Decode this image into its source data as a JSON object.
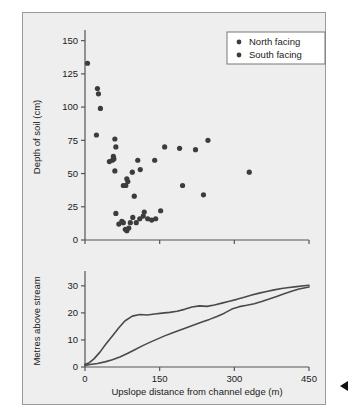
{
  "figure": {
    "background": "#eeeeee",
    "frame_color": "#9a9a9a",
    "annotation_marker": "left-pointing-triangle"
  },
  "legend": {
    "entries": [
      {
        "label": "North facing",
        "color": "#3c3c3c"
      },
      {
        "label": "South facing",
        "color": "#3c3c3c"
      }
    ]
  },
  "chart_data": [
    {
      "type": "scatter",
      "title": "",
      "xlabel": "",
      "ylabel": "Depth of soil (cm)",
      "xlim": [
        0,
        450
      ],
      "ylim": [
        0,
        155
      ],
      "xticks": [
        0,
        150,
        300,
        450
      ],
      "xtick_labels": [
        "",
        "",
        "",
        ""
      ],
      "yticks": [
        0,
        25,
        50,
        75,
        100,
        125,
        150
      ],
      "ytick_labels": [
        "0",
        "25",
        "50",
        "75",
        "100",
        "125",
        "150"
      ],
      "grid": false,
      "legend_position": "top-right",
      "series": [
        {
          "name": "North facing",
          "color": "#3c3c3c",
          "points": [
            [
              5,
              133
            ],
            [
              25,
              114
            ],
            [
              27,
              110
            ],
            [
              31,
              99
            ],
            [
              23,
              79
            ],
            [
              60,
              76
            ],
            [
              62,
              70
            ],
            [
              49,
              59
            ],
            [
              55,
              60
            ],
            [
              58,
              61
            ],
            [
              57,
              63
            ],
            [
              60,
              52
            ],
            [
              77,
              41
            ],
            [
              82,
              41
            ],
            [
              84,
              46
            ],
            [
              86,
              44
            ],
            [
              95,
              51
            ],
            [
              106,
              60
            ],
            [
              111,
              53
            ],
            [
              99,
              33
            ],
            [
              140,
              60
            ],
            [
              160,
              70
            ],
            [
              190,
              69
            ],
            [
              222,
              68
            ],
            [
              247,
              75
            ],
            [
              196,
              41
            ],
            [
              238,
              34
            ],
            [
              330,
              51
            ]
          ]
        },
        {
          "name": "South facing",
          "color": "#3c3c3c",
          "points": [
            [
              62,
              20
            ],
            [
              68,
              12
            ],
            [
              74,
              14
            ],
            [
              77,
              13
            ],
            [
              81,
              8
            ],
            [
              84,
              7
            ],
            [
              88,
              9
            ],
            [
              91,
              13
            ],
            [
              96,
              17
            ],
            [
              103,
              13
            ],
            [
              110,
              16
            ],
            [
              117,
              18
            ],
            [
              119,
              21
            ],
            [
              126,
              16
            ],
            [
              134,
              15
            ],
            [
              142,
              16
            ],
            [
              152,
              22
            ]
          ]
        }
      ]
    },
    {
      "type": "line",
      "title": "",
      "xlabel": "Upslope distance from channel edge (m)",
      "ylabel": "Metres above stream",
      "xlim": [
        0,
        450
      ],
      "ylim": [
        0,
        34
      ],
      "xticks": [
        0,
        150,
        300,
        450
      ],
      "xtick_labels": [
        "0",
        "150",
        "300",
        "450"
      ],
      "yticks": [
        0,
        10,
        20,
        30
      ],
      "ytick_labels": [
        "0",
        "10",
        "20",
        "30"
      ],
      "grid": false,
      "series": [
        {
          "name": "North facing profile",
          "color": "#4a4a4a",
          "x": [
            0,
            8,
            18,
            30,
            42,
            55,
            68,
            80,
            95,
            110,
            125,
            140,
            155,
            170,
            185,
            200,
            215,
            230,
            245,
            260,
            275,
            290,
            305,
            320,
            335,
            350,
            365,
            380,
            395,
            410,
            425,
            440,
            450
          ],
          "y": [
            1.0,
            1.5,
            3.0,
            5.5,
            8.5,
            11.5,
            14.5,
            17.0,
            18.8,
            19.4,
            19.2,
            19.6,
            19.9,
            20.2,
            20.6,
            21.3,
            22.2,
            22.6,
            22.4,
            22.9,
            23.6,
            24.3,
            25.0,
            25.8,
            26.6,
            27.3,
            27.9,
            28.5,
            29.0,
            29.4,
            29.7,
            30.0,
            30.2
          ]
        },
        {
          "name": "South facing profile",
          "color": "#4a4a4a",
          "x": [
            0,
            10,
            25,
            40,
            55,
            70,
            85,
            100,
            115,
            130,
            145,
            160,
            175,
            190,
            205,
            220,
            235,
            250,
            265,
            280,
            295,
            310,
            325,
            340,
            355,
            370,
            385,
            400,
            415,
            430,
            445,
            450
          ],
          "y": [
            0.6,
            0.9,
            1.3,
            1.9,
            2.7,
            3.7,
            5.0,
            6.4,
            7.8,
            9.1,
            10.3,
            11.5,
            12.6,
            13.6,
            14.6,
            15.6,
            16.6,
            17.6,
            18.7,
            19.9,
            21.4,
            22.3,
            22.8,
            23.4,
            24.2,
            25.1,
            26.1,
            27.1,
            28.0,
            28.8,
            29.4,
            29.6
          ]
        }
      ]
    }
  ]
}
